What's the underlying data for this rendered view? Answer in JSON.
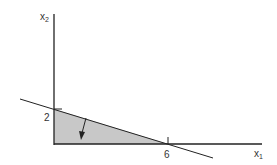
{
  "diagram": {
    "type": "feasible-region-plot",
    "axes": {
      "x_label": "x",
      "x_sub": "1",
      "y_label": "x",
      "y_sub": "2"
    },
    "ticks": {
      "y_intercept": "2",
      "x_intercept": "6"
    },
    "colors": {
      "region_fill": "#c8c8c8",
      "line": "#222222",
      "text": "#333333"
    }
  }
}
